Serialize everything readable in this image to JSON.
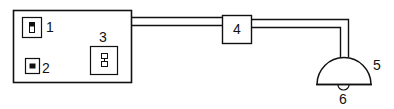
{
  "diagram": {
    "type": "wiring-diagram",
    "stroke_color": "#111111",
    "background": "#ffffff",
    "components": [
      {
        "id": "1",
        "label": "1",
        "description": "toggle switch on control panel"
      },
      {
        "id": "2",
        "label": "2",
        "description": "push button / indicator on control panel"
      },
      {
        "id": "3",
        "label": "3",
        "description": "outlet / double switch on control panel"
      },
      {
        "id": "4",
        "label": "4",
        "description": "junction box on cable"
      },
      {
        "id": "5",
        "label": "5",
        "description": "dome lamp fixture"
      },
      {
        "id": "6",
        "label": "6",
        "description": "bulb beneath lamp"
      }
    ],
    "connections": [
      {
        "from": "panel",
        "to": "4"
      },
      {
        "from": "4",
        "to": "5"
      }
    ]
  }
}
